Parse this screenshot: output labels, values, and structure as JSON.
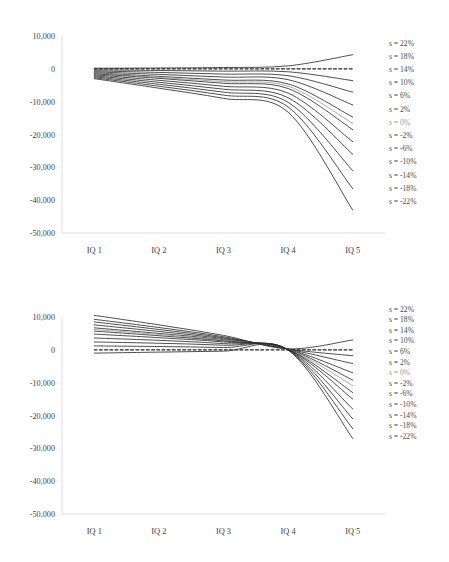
{
  "figure": {
    "name": "two-panel-line-chart",
    "background_color": "#ffffff",
    "line_color": "#2e2e2e",
    "faint_line_color": "#9d9d9d",
    "axis_color": "#d4d4d4"
  },
  "chart_data": [
    {
      "type": "line",
      "panel": "top",
      "title": "",
      "subtitle": "",
      "xlabel": "",
      "ylabel": "",
      "grid": false,
      "legend_position": "right-inline",
      "categories": [
        "IQ 1",
        "IQ 2",
        "IQ 3",
        "IQ 4",
        "IQ 5"
      ],
      "ylim": [
        -50000,
        10000
      ],
      "yticks": [
        10000,
        0,
        -10000,
        -20000,
        -30000,
        -40000,
        -50000
      ],
      "ytick_labels": [
        "10,000",
        "0",
        "-10,000",
        "-20,000",
        "-30,000",
        "-40,000",
        "-50,000"
      ],
      "series": [
        {
          "name": "s = 22%",
          "label": "s = 22%",
          "style": "solid",
          "emphasis": "normal",
          "values": [
            200,
            250,
            400,
            900,
            4300
          ]
        },
        {
          "name": "s = 18%",
          "label": "s = 18%",
          "style": "dashed",
          "emphasis": "normal",
          "values": [
            0,
            0,
            0,
            0,
            0
          ]
        },
        {
          "name": "s = 14%",
          "label": "s = 14%",
          "style": "solid",
          "emphasis": "normal",
          "values": [
            -300,
            -500,
            -700,
            -900,
            -3600
          ]
        },
        {
          "name": "s = 10%",
          "label": "s = 10%",
          "style": "solid",
          "emphasis": "normal",
          "values": [
            -600,
            -1100,
            -1600,
            -2100,
            -7100
          ]
        },
        {
          "name": "s = 6%",
          "label": "s = 6%",
          "style": "solid",
          "emphasis": "normal",
          "values": [
            -900,
            -1700,
            -2500,
            -3300,
            -11000
          ]
        },
        {
          "name": "s = 2%",
          "label": "s = 2%",
          "style": "solid",
          "emphasis": "normal",
          "values": [
            -1200,
            -2300,
            -3400,
            -4600,
            -14700
          ]
        },
        {
          "name": "s = 0%",
          "label": "s = 0%",
          "style": "solid",
          "emphasis": "faint",
          "values": [
            -1350,
            -2600,
            -3900,
            -5300,
            -16600
          ]
        },
        {
          "name": "s = -2%",
          "label": "s = -2%",
          "style": "solid",
          "emphasis": "normal",
          "values": [
            -1500,
            -2900,
            -4400,
            -6000,
            -18500
          ]
        },
        {
          "name": "s = -6%",
          "label": "s = -6%",
          "style": "solid",
          "emphasis": "normal",
          "values": [
            -1800,
            -3500,
            -5300,
            -7400,
            -22200
          ]
        },
        {
          "name": "s = -10%",
          "label": "s = -10%",
          "style": "solid",
          "emphasis": "normal",
          "values": [
            -2100,
            -4100,
            -6200,
            -8800,
            -26000
          ]
        },
        {
          "name": "s = -14%",
          "label": "s = -14%",
          "style": "solid",
          "emphasis": "normal",
          "values": [
            -2400,
            -4700,
            -7100,
            -10200,
            -31000
          ]
        },
        {
          "name": "s = -18%",
          "label": "s = -18%",
          "style": "solid",
          "emphasis": "normal",
          "values": [
            -2700,
            -5300,
            -8000,
            -11600,
            -36500
          ]
        },
        {
          "name": "s = -22%",
          "label": "s = -22%",
          "style": "solid",
          "emphasis": "normal",
          "values": [
            -3000,
            -5900,
            -9000,
            -13200,
            -43000
          ]
        }
      ]
    },
    {
      "type": "line",
      "panel": "bottom",
      "title": "",
      "subtitle": "",
      "xlabel": "",
      "ylabel": "",
      "grid": false,
      "legend_position": "right-inline",
      "categories": [
        "IQ 1",
        "IQ 2",
        "IQ 3",
        "IQ 4",
        "IQ 5"
      ],
      "ylim": [
        -50000,
        10000
      ],
      "yticks": [
        10000,
        0,
        -10000,
        -20000,
        -30000,
        -40000,
        -50000
      ],
      "ytick_labels": [
        "10,000",
        "0",
        "-10,000",
        "-20,000",
        "-30,000",
        "-40,000",
        "-50,000"
      ],
      "series": [
        {
          "name": "s = 22%",
          "label": "s = 22%",
          "style": "solid",
          "emphasis": "normal",
          "values": [
            10500,
            7600,
            4400,
            300,
            3000
          ]
        },
        {
          "name": "s = 18%",
          "label": "s = 18%",
          "style": "dashed",
          "emphasis": "normal",
          "values": [
            0,
            0,
            0,
            0,
            0
          ]
        },
        {
          "name": "s = 14%",
          "label": "s = 14%",
          "style": "solid",
          "emphasis": "normal",
          "values": [
            9300,
            6800,
            4000,
            250,
            -1800
          ]
        },
        {
          "name": "s = 10%",
          "label": "s = 10%",
          "style": "solid",
          "emphasis": "normal",
          "values": [
            8500,
            6200,
            3700,
            220,
            -4200
          ]
        },
        {
          "name": "s = 6%",
          "label": "s = 6%",
          "style": "solid",
          "emphasis": "normal",
          "values": [
            7600,
            5600,
            3400,
            200,
            -7000
          ]
        },
        {
          "name": "s = 2%",
          "label": "s = 2%",
          "style": "solid",
          "emphasis": "normal",
          "values": [
            6700,
            5000,
            3100,
            180,
            -9200
          ]
        },
        {
          "name": "s = 0%",
          "label": "s = 0%",
          "style": "solid",
          "emphasis": "faint",
          "values": [
            6200,
            4700,
            2900,
            160,
            -10900
          ]
        },
        {
          "name": "s = -2%",
          "label": "s = -2%",
          "style": "solid",
          "emphasis": "normal",
          "values": [
            5700,
            4300,
            2700,
            140,
            -13000
          ]
        },
        {
          "name": "s = -6%",
          "label": "s = -6%",
          "style": "solid",
          "emphasis": "normal",
          "values": [
            4800,
            3700,
            2400,
            110,
            -15000
          ]
        },
        {
          "name": "s = -10%",
          "label": "s = -10%",
          "style": "solid",
          "emphasis": "normal",
          "values": [
            3600,
            2900,
            1900,
            80,
            -18000
          ]
        },
        {
          "name": "s = -14%",
          "label": "s = -14%",
          "style": "solid",
          "emphasis": "normal",
          "values": [
            2400,
            2000,
            1400,
            50,
            -21000
          ]
        },
        {
          "name": "s = -18%",
          "label": "s = -18%",
          "style": "solid",
          "emphasis": "normal",
          "values": [
            1200,
            1000,
            700,
            20,
            -24000
          ]
        },
        {
          "name": "s = -22%",
          "label": "s = -22%",
          "style": "solid",
          "emphasis": "normal",
          "values": [
            -1000,
            -700,
            -400,
            -100,
            -27000
          ]
        }
      ]
    }
  ]
}
